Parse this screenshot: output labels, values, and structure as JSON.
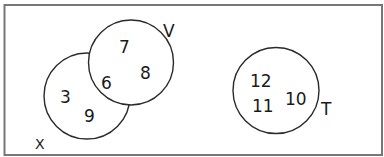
{
  "diagram": {
    "type": "venn",
    "universal_set_label": "X",
    "sets": [
      {
        "name": "V",
        "elements_only": [
          "7",
          "8"
        ]
      },
      {
        "name": "unlabeled",
        "elements_only": [
          "3",
          "9"
        ]
      },
      {
        "name": "T",
        "elements_only": [
          "12",
          "11",
          "10"
        ]
      }
    ],
    "intersection_V_unlabeled": [
      "6"
    ],
    "labels": {
      "universal": "X",
      "V": "V",
      "T": "T"
    },
    "numbers": {
      "n3": "3",
      "n9": "9",
      "n6": "6",
      "n7": "7",
      "n8": "8",
      "n12": "12",
      "n11": "11",
      "n10": "10"
    },
    "colors": {
      "stroke": "#2a2a2a",
      "border": "#777777",
      "background": "#ffffff"
    }
  }
}
